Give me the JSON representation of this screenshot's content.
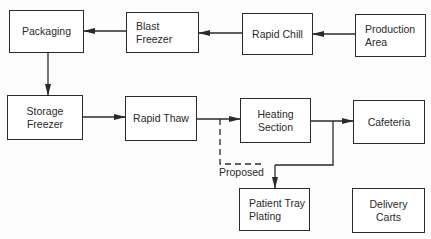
{
  "diagram": {
    "type": "flowchart",
    "nodes": {
      "packaging": "Packaging",
      "blast_freezer": "Blast\nFreezer",
      "rapid_chill": "Rapid Chill",
      "production_area": "Production\nArea",
      "storage_freezer": "Storage\nFreezer",
      "rapid_thaw": "Rapid Thaw",
      "heating_section": "Heating\nSection",
      "cafeteria": "Cafeteria",
      "patient_tray_plating": "Patient Tray\nPlating",
      "delivery_carts": "Delivery\nCarts"
    },
    "edges": [
      {
        "from": "Production Area",
        "to": "Rapid Chill",
        "style": "solid"
      },
      {
        "from": "Rapid Chill",
        "to": "Blast Freezer",
        "style": "solid"
      },
      {
        "from": "Blast Freezer",
        "to": "Packaging",
        "style": "solid"
      },
      {
        "from": "Packaging",
        "to": "Storage Freezer",
        "style": "solid"
      },
      {
        "from": "Storage Freezer",
        "to": "Rapid Thaw",
        "style": "solid"
      },
      {
        "from": "Rapid Thaw",
        "to": "Heating Section",
        "style": "solid"
      },
      {
        "from": "Heating Section",
        "to": "Cafeteria",
        "style": "solid"
      },
      {
        "from": "Heating Section",
        "to": "Patient Tray Plating",
        "style": "solid"
      },
      {
        "from": "Rapid Thaw",
        "to": "Patient Tray Plating",
        "style": "dashed",
        "label": "Proposed"
      },
      {
        "from": "Patient Tray Plating",
        "to": "Delivery Carts",
        "style": "solid"
      }
    ],
    "annotations": {
      "proposed": "Proposed"
    },
    "colors": {
      "line": "#2a2a2a",
      "background": "#fdfdfd"
    }
  }
}
